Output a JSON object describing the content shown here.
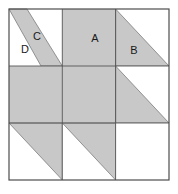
{
  "diagram": {
    "grid": {
      "rows": 3,
      "cols": 3
    },
    "colors": {
      "fabric_gray": "#c8c8c8",
      "fabric_white": "#ffffff",
      "outline": "#4d4d4d",
      "grid_line": "#555555",
      "label_text": "#1a1a1a",
      "background": "#ffffff"
    },
    "bounds": {
      "x": 9,
      "y": 9,
      "width": 160,
      "height": 171
    },
    "labels": [
      {
        "id": "A",
        "text": "A",
        "x": 95,
        "y": 39
      },
      {
        "id": "B",
        "text": "B",
        "x": 134,
        "y": 51
      },
      {
        "id": "C",
        "text": "C",
        "x": 37,
        "y": 37
      },
      {
        "id": "D",
        "text": "D",
        "x": 25,
        "y": 50
      }
    ],
    "cells": [
      {
        "id": "r1c1",
        "row": 1,
        "col": 1,
        "shape": "diagonal-band",
        "fill": "gray",
        "pieces": [
          "C",
          "D"
        ]
      },
      {
        "id": "r1c2",
        "row": 1,
        "col": 2,
        "shape": "full-square",
        "fill": "gray",
        "pieces": [
          "A"
        ]
      },
      {
        "id": "r1c3",
        "row": 1,
        "col": 3,
        "shape": "triangle-lower-left",
        "fill": "gray",
        "pieces": [
          "B"
        ]
      },
      {
        "id": "r2c1",
        "row": 2,
        "col": 1,
        "shape": "full-square",
        "fill": "gray",
        "pieces": []
      },
      {
        "id": "r2c2",
        "row": 2,
        "col": 2,
        "shape": "full-square",
        "fill": "gray",
        "pieces": []
      },
      {
        "id": "r2c3",
        "row": 2,
        "col": 3,
        "shape": "triangle-lower-left",
        "fill": "gray",
        "pieces": []
      },
      {
        "id": "r3c1",
        "row": 3,
        "col": 1,
        "shape": "triangle-upper-right",
        "fill": "gray",
        "pieces": []
      },
      {
        "id": "r3c2",
        "row": 3,
        "col": 2,
        "shape": "triangle-upper-right",
        "fill": "gray",
        "pieces": []
      },
      {
        "id": "r3c3",
        "row": 3,
        "col": 3,
        "shape": "empty-square",
        "fill": "white",
        "pieces": []
      }
    ]
  }
}
